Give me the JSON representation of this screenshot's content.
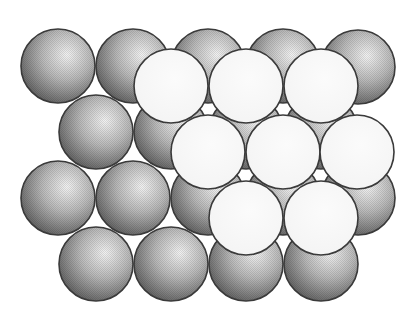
{
  "diagram": {
    "title": "",
    "canvas": {
      "width": 413,
      "height": 321,
      "background": "#ffffff"
    },
    "sphere_radius": 37,
    "colors": {
      "outline": "#3a3a3a",
      "grey_highlight": "#f2f2f2",
      "grey_mid": "#b8b8b8",
      "grey_shadow": "#555555",
      "white_fill": "#fbfbfb",
      "white_shade": "#e6e6e6",
      "void_shadow": "#707070"
    },
    "layers": [
      {
        "name": "lower-layer",
        "style": "grey",
        "spheres": [
          {
            "x": 58,
            "y": 66
          },
          {
            "x": 133,
            "y": 66
          },
          {
            "x": 208,
            "y": 66
          },
          {
            "x": 283,
            "y": 66
          },
          {
            "x": 358,
            "y": 67
          },
          {
            "x": 96,
            "y": 132
          },
          {
            "x": 171,
            "y": 132
          },
          {
            "x": 246,
            "y": 132
          },
          {
            "x": 321,
            "y": 132
          },
          {
            "x": 58,
            "y": 198
          },
          {
            "x": 133,
            "y": 198
          },
          {
            "x": 208,
            "y": 198
          },
          {
            "x": 283,
            "y": 198
          },
          {
            "x": 358,
            "y": 198
          },
          {
            "x": 96,
            "y": 264
          },
          {
            "x": 171,
            "y": 264
          },
          {
            "x": 246,
            "y": 264
          },
          {
            "x": 321,
            "y": 264
          }
        ]
      },
      {
        "name": "upper-layer",
        "style": "white",
        "spheres": [
          {
            "x": 171,
            "y": 86
          },
          {
            "x": 246,
            "y": 86
          },
          {
            "x": 321,
            "y": 86
          },
          {
            "x": 208,
            "y": 152
          },
          {
            "x": 283,
            "y": 152
          },
          {
            "x": 357,
            "y": 152
          },
          {
            "x": 246,
            "y": 218
          },
          {
            "x": 321,
            "y": 218
          }
        ]
      }
    ]
  }
}
